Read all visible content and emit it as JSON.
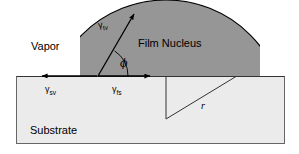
{
  "figure": {
    "type": "schematic-diagram",
    "background_color": "#ffffff"
  },
  "regions": {
    "vapor": {
      "label": "Vapor",
      "fill_color": "#ffffff"
    },
    "nucleus": {
      "label": "Film Nucleus",
      "fill_color": "#969696",
      "stroke_color": "#000000"
    },
    "substrate": {
      "label": "Substrate",
      "fill_color": "#ebebeb",
      "stroke_color": "#555555"
    }
  },
  "vectors": [
    {
      "name": "gamma-tv",
      "symbol": "γ",
      "subscript": "tv",
      "description": "film-vapor surface tension, tangent to nucleus at contact point, arrow up-right"
    },
    {
      "name": "gamma-sv",
      "symbol": "γ",
      "subscript": "sv",
      "description": "substrate-vapor surface tension, arrow pointing left along surface"
    },
    {
      "name": "gamma-fs",
      "symbol": "γ",
      "subscript": "fs",
      "description": "film-substrate surface tension, arrow pointing right along surface"
    }
  ],
  "annotations": {
    "contact_angle": {
      "label": "ϕ",
      "name": "phi",
      "description": "contact angle between substrate surface and nucleus tangent"
    },
    "radius": {
      "label": "r",
      "name": "r",
      "description": "radius of curvature of the spherical cap nucleus"
    }
  },
  "geometry": {
    "substrate_rect": {
      "x": 16,
      "y": 76,
      "width": 269,
      "height": 68
    },
    "surface_line_y": 76,
    "contact_left": {
      "x": 98,
      "y": 76
    },
    "contact_right": {
      "x": 236,
      "y": 76
    },
    "cap_apex": {
      "x": 175,
      "y": 20
    },
    "circle_center": {
      "x": 166,
      "y": 119
    },
    "gamma_tv_arrow_tip": {
      "x": 136,
      "y": 12
    },
    "gamma_sv_arrow_tip": {
      "x": 40,
      "y": 76
    },
    "gamma_fs_arrow_tip": {
      "x": 152,
      "y": 76
    }
  }
}
